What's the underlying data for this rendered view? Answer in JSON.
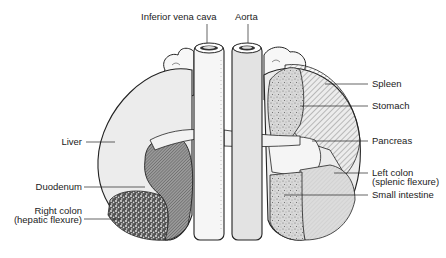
{
  "diagram": {
    "type": "anatomical illustration",
    "vessels": [
      {
        "id": "ivc",
        "label": "Inferior vena cava"
      },
      {
        "id": "aorta",
        "label": "Aorta"
      }
    ],
    "left_side_labels": [
      {
        "id": "liver",
        "label": "Liver"
      },
      {
        "id": "duodenum",
        "label": "Duodenum"
      },
      {
        "id": "right_colon",
        "label": "Right colon",
        "sublabel": "(hepatic flexure)"
      }
    ],
    "right_side_labels": [
      {
        "id": "spleen",
        "label": "Spleen"
      },
      {
        "id": "stomach",
        "label": "Stomach"
      },
      {
        "id": "pancreas",
        "label": "Pancreas"
      },
      {
        "id": "left_colon",
        "label": "Left colon",
        "sublabel": "(splenic flexure)"
      },
      {
        "id": "small_intestine",
        "label": "Small intestine"
      }
    ]
  },
  "colors": {
    "outline": "#222222",
    "kidney_fill": "#ececec",
    "vessel_fill": "#e6e6e6",
    "adrenal_fill": "#f7f7f7",
    "background": "#ffffff"
  }
}
